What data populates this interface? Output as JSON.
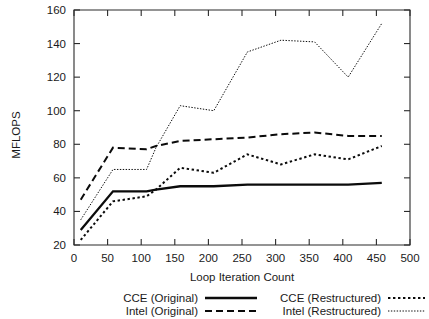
{
  "chart_data": {
    "type": "line",
    "title": "",
    "xlabel": "Loop Iteration Count",
    "ylabel": "MFLOPS",
    "xlim": [
      0,
      500
    ],
    "ylim": [
      20,
      160
    ],
    "xticks": [
      0,
      50,
      100,
      150,
      200,
      250,
      300,
      350,
      400,
      450,
      500
    ],
    "yticks": [
      20,
      40,
      60,
      80,
      100,
      120,
      140,
      160
    ],
    "grid": false,
    "legend_position": "below-axes",
    "series": [
      {
        "name": "CCE (Original)",
        "style": "solid",
        "x": [
          10,
          58,
          108,
          122,
          158,
          208,
          258,
          308,
          358,
          408,
          458
        ],
        "values": [
          29,
          52,
          52,
          53,
          55,
          55,
          56,
          56,
          56,
          56,
          57
        ]
      },
      {
        "name": "Intel (Original)",
        "style": "dashed",
        "x": [
          10,
          58,
          108,
          122,
          158,
          208,
          258,
          308,
          358,
          408,
          458
        ],
        "values": [
          47,
          78,
          77,
          79,
          82,
          83,
          84,
          86,
          87,
          85,
          85
        ]
      },
      {
        "name": "CCE (Restructured)",
        "style": "dotted",
        "x": [
          10,
          58,
          108,
          122,
          158,
          208,
          258,
          308,
          358,
          408,
          458
        ],
        "values": [
          23,
          46,
          49,
          53,
          66,
          63,
          74,
          68,
          74,
          71,
          79
        ]
      },
      {
        "name": "Intel (Restructured)",
        "style": "fine-dotted",
        "x": [
          10,
          58,
          108,
          122,
          158,
          208,
          258,
          308,
          358,
          408,
          458
        ],
        "values": [
          35,
          65,
          65,
          78,
          103,
          100,
          135,
          142,
          141,
          120,
          152
        ]
      }
    ]
  },
  "legend": {
    "entries": [
      {
        "label": "CCE (Original)",
        "style": "solid"
      },
      {
        "label": "Intel (Original)",
        "style": "dashed"
      },
      {
        "label": "CCE (Restructured)",
        "style": "dotted"
      },
      {
        "label": "Intel (Restructured)",
        "style": "fine-dotted"
      }
    ]
  },
  "colors": {
    "ink": "#0b0b0b",
    "axis": "#2b2b2b",
    "background": "#ffffff"
  }
}
